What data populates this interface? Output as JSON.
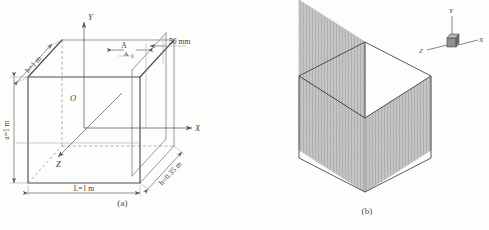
{
  "figure": {
    "type": "two-panel-engineering-figure",
    "background_color": "#fdfdfc",
    "ink_color": "#4d4d4d"
  },
  "panel_a": {
    "caption": "(a)",
    "description": "Isometric dimensioned line drawing of a rectangular box (cuboid) with Cartesian coordinate axes at its geometric center",
    "origin_label": "O",
    "axes": [
      {
        "name": "y-axis",
        "label": "Y",
        "direction": "up"
      },
      {
        "name": "x-axis",
        "label": "X",
        "direction": "right"
      },
      {
        "name": "z-axis",
        "label": "Z",
        "direction": "down-left"
      }
    ],
    "dimensions": [
      {
        "name": "depth",
        "label": "b=1 m",
        "value": 1,
        "unit": "m",
        "placement": "top-left-diagonal-edge"
      },
      {
        "name": "height",
        "label": "a=1 m",
        "value": 1,
        "unit": "m",
        "placement": "left-vertical"
      },
      {
        "name": "length",
        "label": "L=1 m",
        "value": 1,
        "unit": "m",
        "placement": "bottom-horizontal"
      },
      {
        "name": "offset",
        "label": "h=0.35 m",
        "value": 0.35,
        "unit": "m",
        "placement": "bottom-right-diagonal"
      },
      {
        "name": "slice-thickness",
        "label": "50 mm",
        "value": 50,
        "unit": "mm",
        "placement": "top-right-leader"
      }
    ],
    "section_marker": {
      "label_top": "A",
      "label_bottom": "A",
      "subscript": "1"
    }
  },
  "panel_b": {
    "caption": "(b)",
    "description": "Dense finite-element hexahedral mesh of the same cuboid shown in isometric view",
    "triad": {
      "name": "coordinate-triad",
      "x_label": "X",
      "y_label": "Y",
      "z_label": "Z"
    },
    "mesh": {
      "line_color": "#575757",
      "outline_color": "#3c3c3c",
      "divisions_u": 44,
      "divisions_v": 44
    }
  },
  "bottom_clipped_caption": ""
}
